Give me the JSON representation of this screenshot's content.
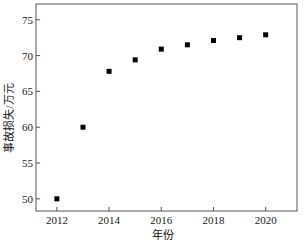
{
  "chart_data": {
    "type": "scatter",
    "title": "",
    "xlabel": "年份",
    "ylabel": "事故损失/万元",
    "x": [
      2012,
      2013,
      2014,
      2015,
      2016,
      2017,
      2018,
      2019,
      2020
    ],
    "series": [
      {
        "name": "事故损失",
        "marker": "square",
        "color": "#000000",
        "values": [
          50.0,
          60.0,
          67.8,
          69.4,
          70.9,
          71.5,
          72.1,
          72.5,
          72.9
        ]
      }
    ],
    "xticks": [
      2012,
      2014,
      2016,
      2018,
      2020
    ],
    "yticks": [
      50,
      55,
      60,
      65,
      70,
      75
    ],
    "xlim": [
      2011.2,
      2021.2
    ],
    "ylim": [
      48.3,
      77.2
    ],
    "grid": false,
    "legend": null
  }
}
